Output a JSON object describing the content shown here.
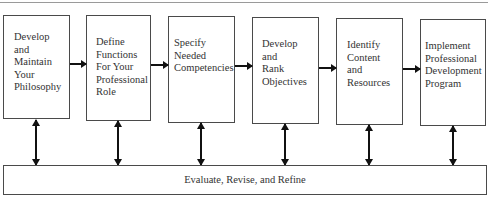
{
  "diagram": {
    "steps": [
      {
        "lines": [
          "Develop",
          "and",
          "Maintain",
          "Your",
          "Philosophy"
        ]
      },
      {
        "lines": [
          "Define",
          "Functions",
          "For Your",
          "Professional",
          "Role"
        ]
      },
      {
        "lines": [
          "Specify",
          "Needed",
          "Competencies"
        ]
      },
      {
        "lines": [
          "Develop",
          "and",
          "Rank",
          "Objectives"
        ]
      },
      {
        "lines": [
          "Identify",
          "Content",
          "and",
          "Resources"
        ]
      },
      {
        "lines": [
          "Implement",
          "Professional",
          "Development",
          "Program"
        ]
      }
    ],
    "feedback": {
      "label": "Evaluate, Revise, and Refine"
    },
    "colors": {
      "border": "#4a4a4a",
      "arrow": "#111111",
      "text": "#333333"
    }
  }
}
